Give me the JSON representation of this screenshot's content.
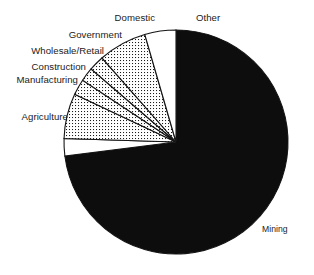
{
  "chart_data": {
    "type": "pie",
    "title": "",
    "subtitle": "",
    "xlabel": "",
    "ylabel": "",
    "legend_position": "none",
    "grid": false,
    "labels_inline": true,
    "categories": [
      "Mining",
      "Other",
      "Domestic",
      "Government",
      "Wholesale/Retail",
      "Construction",
      "Manufacturing",
      "Agriculture"
    ],
    "values": [
      73.0,
      4.5,
      7.0,
      2.2,
      2.0,
      2.3,
      6.5,
      2.5
    ],
    "slices": [
      {
        "name": "Mining",
        "value": 73.0,
        "fill": "solid-black",
        "color": "#0d0d0d",
        "start_angle_deg": 0,
        "end_angle_deg": 262.8,
        "label": "Mining",
        "label_x": 262,
        "label_y": 232,
        "label_anchor": "start",
        "leader": false
      },
      {
        "name": "Agriculture",
        "value": 2.5,
        "fill": "white",
        "color": "#ffffff",
        "start_angle_deg": 262.8,
        "end_angle_deg": 271.8,
        "label": "Agriculture",
        "label_x": 68,
        "label_y": 120,
        "label_anchor": "end",
        "leader": true,
        "leader_from_x": 70,
        "leader_from_y": 116,
        "leader_to_x": 88,
        "leader_to_y": 116
      },
      {
        "name": "Manufacturing",
        "value": 6.5,
        "fill": "dotted",
        "color": "#ffffff",
        "start_angle_deg": 271.8,
        "end_angle_deg": 295.2,
        "label": "Manufacturing",
        "label_x": 78,
        "label_y": 83,
        "label_anchor": "end",
        "leader": true,
        "leader_from_x": 80,
        "leader_from_y": 79,
        "leader_to_x": 94,
        "leader_to_y": 79
      },
      {
        "name": "Construction",
        "value": 2.3,
        "fill": "dotted",
        "color": "#ffffff",
        "start_angle_deg": 295.2,
        "end_angle_deg": 303.5,
        "label": "Construction",
        "label_x": 86,
        "label_y": 70,
        "label_anchor": "end",
        "leader": true,
        "leader_from_x": 88,
        "leader_from_y": 66,
        "leader_to_x": 102,
        "leader_to_y": 66
      },
      {
        "name": "Wholesale/Retail",
        "value": 2.0,
        "fill": "dotted",
        "color": "#ffffff",
        "start_angle_deg": 303.5,
        "end_angle_deg": 310.7,
        "label": "Wholesale/Retail",
        "label_x": 104,
        "label_y": 54,
        "label_anchor": "end",
        "leader": true,
        "leader_from_x": 106,
        "leader_from_y": 50,
        "leader_to_x": 118,
        "leader_to_y": 50
      },
      {
        "name": "Government",
        "value": 2.2,
        "fill": "dotted",
        "color": "#ffffff",
        "start_angle_deg": 310.7,
        "end_angle_deg": 318.6,
        "label": "Government",
        "label_x": 122,
        "label_y": 38,
        "label_anchor": "end",
        "leader": true,
        "leader_from_x": 124,
        "leader_from_y": 34,
        "leader_to_x": 136,
        "leader_to_y": 34
      },
      {
        "name": "Domestic",
        "value": 7.0,
        "fill": "dotted",
        "color": "#ffffff",
        "start_angle_deg": 318.6,
        "end_angle_deg": 343.8,
        "label": "Domestic",
        "label_x": 155,
        "label_y": 21,
        "label_anchor": "end",
        "leader": true,
        "leader_from_x": 150,
        "leader_from_y": 24,
        "leader_to_x": 150,
        "leader_to_y": 34
      },
      {
        "name": "Other",
        "value": 4.5,
        "fill": "white",
        "color": "#ffffff",
        "start_angle_deg": 343.8,
        "end_angle_deg": 360,
        "label": "Other",
        "label_x": 196,
        "label_y": 21,
        "label_anchor": "start",
        "leader": true,
        "leader_from_x": 193,
        "leader_from_y": 24,
        "leader_to_x": 193,
        "leader_to_y": 34
      }
    ],
    "geometry": {
      "center_x": 176,
      "center_y": 142,
      "radius": 112
    },
    "style": {
      "stroke": "#141414",
      "background": "#ffffff",
      "solid_fill": "#0d0d0d",
      "pattern_fill": "dot-screen",
      "text_color": "#1a1a1a"
    }
  }
}
